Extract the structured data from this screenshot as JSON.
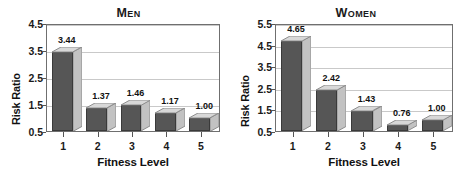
{
  "figure": {
    "background": "#ffffff",
    "bar_front_color": "#565656",
    "bar_side_color": "#c2c2c2",
    "bar_top_color": "#d8d8d8",
    "grid_color": "#c9c9c9",
    "axis_color": "#6f6f6f"
  },
  "chart_data": [
    {
      "type": "bar",
      "title": "Men",
      "categories": [
        "1",
        "2",
        "3",
        "4",
        "5"
      ],
      "values": [
        3.44,
        1.37,
        1.46,
        1.17,
        1.0
      ],
      "labels": [
        "3.44",
        "1.37",
        "1.46",
        "1.17",
        "1.00"
      ],
      "xlabel": "Fitness Level",
      "ylabel": "Risk Ratio",
      "ylim": [
        0.5,
        4.5
      ],
      "yticks": [
        0.5,
        1.5,
        2.5,
        3.5,
        4.5
      ],
      "ytick_labels": [
        "0.5",
        "1.5",
        "2.5",
        "3.5",
        "4.5"
      ],
      "grid": true,
      "legend": "none"
    },
    {
      "type": "bar",
      "title": "Women",
      "categories": [
        "1",
        "2",
        "3",
        "4",
        "5"
      ],
      "values": [
        4.65,
        2.42,
        1.43,
        0.76,
        1.0
      ],
      "labels": [
        "4.65",
        "2.42",
        "1.43",
        "0.76",
        "1.00"
      ],
      "xlabel": "Fitness Level",
      "ylabel": "Risk Ratio",
      "ylim": [
        0.5,
        5.5
      ],
      "yticks": [
        0.5,
        1.5,
        2.5,
        3.5,
        4.5,
        5.5
      ],
      "ytick_labels": [
        "0.5",
        "1.5",
        "2.5",
        "3.5",
        "4.5",
        "5.5"
      ],
      "grid": true,
      "legend": "none"
    }
  ]
}
